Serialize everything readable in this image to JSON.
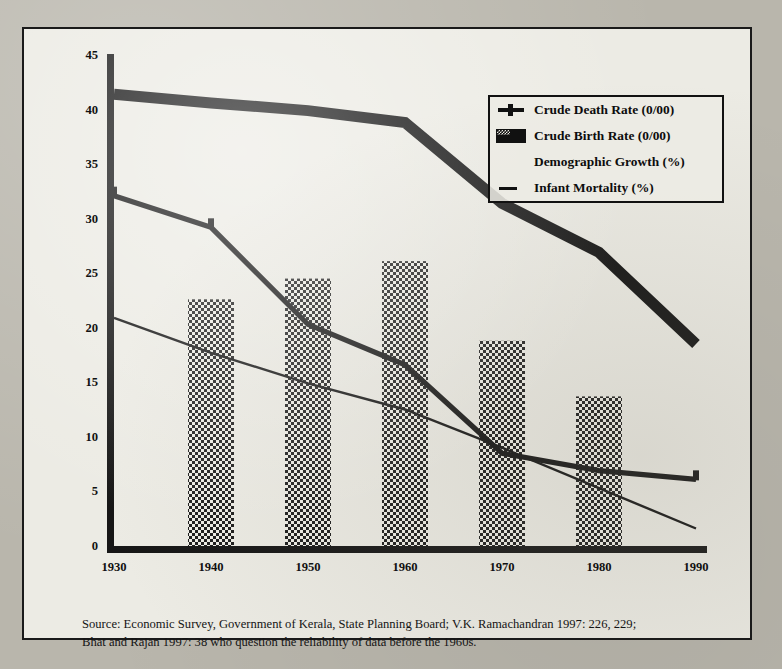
{
  "figure": {
    "background_color": "#ecebe4",
    "page_color": "#b9b6ac",
    "ink_color": "#111111"
  },
  "legend": {
    "items": [
      {
        "label": "Crude Death Rate (0/00)",
        "swatch": "thick-line-with-marker-icon",
        "key": "death"
      },
      {
        "label": "Crude Birth Rate (0/00)",
        "swatch": "thick-filled-band-icon",
        "key": "birth"
      },
      {
        "label": "Demographic Growth (%)",
        "swatch": "crosshatch-bar-icon",
        "key": "demographic"
      },
      {
        "label": "Infant Mortality (%)",
        "swatch": "thin-line-icon",
        "key": "infant"
      }
    ]
  },
  "source": {
    "line1": "Source: Economic Survey, Government of Kerala, State Planning Board; V.K. Ramachandran 1997: 226,",
    "line2": "229;  Bhat and Rajan 1997: 38 who question the reliability of data before the 1960s."
  },
  "ghost_text": {
    "line1": "Aslahatharanatalamanantikharanarvathikkum mathamalatthiram",
    "line2": "athmakalaarvamullathum Varkey nam Salmon arapharivekkalam"
  },
  "chart_data": {
    "type": "line",
    "title": "",
    "subtitle": "",
    "xlabel": "",
    "ylabel": "",
    "x": [
      1930,
      1940,
      1950,
      1960,
      1970,
      1980,
      1990
    ],
    "categories": [
      "1930",
      "1940",
      "1950",
      "1960",
      "1970",
      "1980",
      "1990"
    ],
    "xlim": [
      1925,
      1995
    ],
    "ylim": [
      0,
      45
    ],
    "yticks": [
      0,
      5,
      10,
      15,
      20,
      25,
      30,
      35,
      40,
      45
    ],
    "ytick_labels": [
      "0",
      "5",
      "10",
      "15",
      "20",
      "25",
      "30",
      "35",
      "40",
      "45"
    ],
    "grid": false,
    "legend_position": "upper right",
    "series": [
      {
        "name": "Crude Birth Rate (0/00)",
        "key": "birth",
        "render": "thick-line",
        "values": [
          41.5,
          40.7,
          40.0,
          38.9,
          31.5,
          27.0,
          18.6
        ]
      },
      {
        "name": "Crude Death Rate (0/00)",
        "key": "death",
        "render": "medium-line",
        "values": [
          32.2,
          29.3,
          20.4,
          16.7,
          8.6,
          7.0,
          6.2
        ]
      },
      {
        "name": "Demographic Growth (%)",
        "key": "demographic",
        "render": "crosshatch-bars",
        "values": [
          null,
          22.7,
          24.6,
          26.2,
          18.9,
          13.8,
          null
        ]
      },
      {
        "name": "Infant Mortality (%)",
        "key": "infant",
        "render": "thin-line",
        "values": [
          21.0,
          17.8,
          15.0,
          12.6,
          9.1,
          5.4,
          1.7
        ]
      }
    ]
  }
}
